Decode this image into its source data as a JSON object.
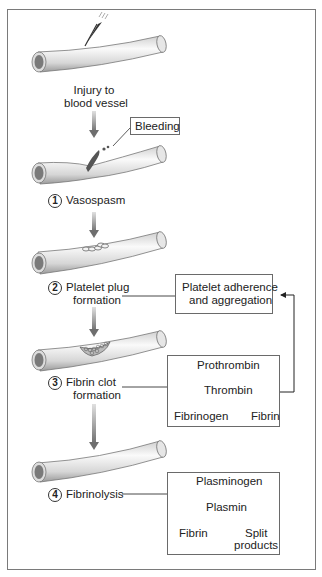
{
  "injury": {
    "line1": "Injury to",
    "line2": "blood vessel"
  },
  "bleeding_label": "Bleeding",
  "steps": [
    {
      "number": "1",
      "line1": "Vasospasm",
      "line2": ""
    },
    {
      "number": "2",
      "line1": "Platelet plug",
      "line2": "formation"
    },
    {
      "number": "3",
      "line1": "Fibrin clot",
      "line2": "formation"
    },
    {
      "number": "4",
      "line1": "Fibrinolysis",
      "line2": ""
    }
  ],
  "boxes": {
    "platelet": {
      "line1": "Platelet adherence",
      "line2": "and aggregation"
    },
    "coagulation": {
      "a": "Prothrombin",
      "b": "Thrombin",
      "c": "Fibrinogen",
      "d": "Fibrin"
    },
    "fibrinolysis": {
      "a": "Plasminogen",
      "b": "Plasmin",
      "c": "Fibrin",
      "d1": "Split",
      "d2": "products"
    }
  },
  "colors": {
    "frame": "#7a7a7a",
    "vessel_dark": "#8a8a8a",
    "vessel_light": "#f2f2f2",
    "arrow": "#8c8c8c",
    "blood": "#555555"
  }
}
